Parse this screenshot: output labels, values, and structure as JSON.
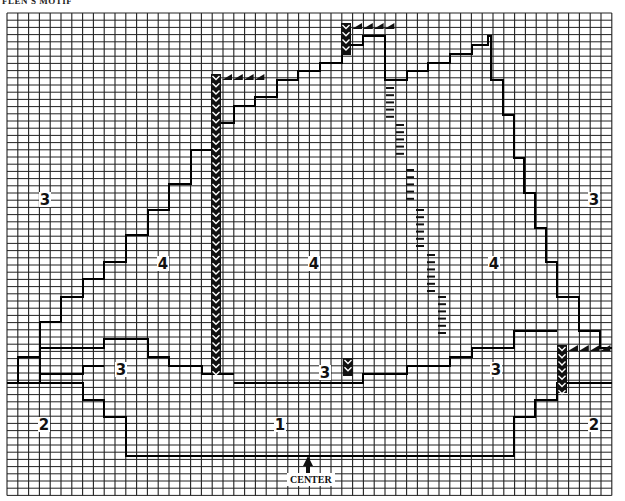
{
  "title": "FLEN'S MOTIF",
  "center_label": "CENTER",
  "grid": {
    "x0": 7,
    "y0": 13,
    "cols": 56,
    "rows": 67,
    "cell_w": 10.8,
    "cell_h": 7.2,
    "line_color": "#222222"
  },
  "zones": [
    {
      "label": "3",
      "x": 45,
      "y": 200
    },
    {
      "label": "4",
      "x": 163,
      "y": 264
    },
    {
      "label": "4",
      "x": 314,
      "y": 264
    },
    {
      "label": "4",
      "x": 494,
      "y": 264
    },
    {
      "label": "3",
      "x": 594,
      "y": 200
    },
    {
      "label": "3",
      "x": 121,
      "y": 370
    },
    {
      "label": "3",
      "x": 325,
      "y": 373
    },
    {
      "label": "3",
      "x": 496,
      "y": 370
    },
    {
      "label": "2",
      "x": 44,
      "y": 425
    },
    {
      "label": "1",
      "x": 280,
      "y": 425
    },
    {
      "label": "2",
      "x": 594,
      "y": 425
    }
  ],
  "outlines": [
    [
      [
        7,
        383
      ],
      [
        18,
        383
      ],
      [
        18,
        357
      ],
      [
        40,
        357
      ],
      [
        40,
        322
      ],
      [
        61,
        322
      ],
      [
        61,
        297
      ],
      [
        83,
        297
      ],
      [
        83,
        279
      ],
      [
        104,
        279
      ],
      [
        104,
        262
      ],
      [
        126,
        262
      ],
      [
        126,
        235
      ],
      [
        148,
        235
      ],
      [
        148,
        210
      ],
      [
        169,
        210
      ],
      [
        169,
        184
      ],
      [
        191,
        184
      ],
      [
        191,
        150
      ],
      [
        212,
        150
      ],
      [
        212,
        123
      ],
      [
        234,
        123
      ],
      [
        234,
        106
      ],
      [
        255,
        106
      ],
      [
        255,
        97
      ],
      [
        277,
        97
      ],
      [
        277,
        80
      ],
      [
        298,
        80
      ],
      [
        298,
        71
      ],
      [
        320,
        71
      ],
      [
        320,
        63
      ],
      [
        342,
        63
      ],
      [
        342,
        45
      ],
      [
        363,
        45
      ],
      [
        363,
        36
      ],
      [
        385,
        36
      ],
      [
        385,
        80
      ],
      [
        407,
        80
      ],
      [
        407,
        71
      ],
      [
        428,
        71
      ],
      [
        428,
        63
      ],
      [
        450,
        63
      ],
      [
        450,
        54
      ],
      [
        472,
        54
      ],
      [
        472,
        45
      ],
      [
        488,
        45
      ],
      [
        488,
        36
      ],
      [
        491,
        36
      ],
      [
        491,
        80
      ],
      [
        503,
        80
      ],
      [
        503,
        115
      ],
      [
        514,
        115
      ],
      [
        514,
        158
      ],
      [
        524,
        158
      ],
      [
        524,
        193
      ],
      [
        535,
        193
      ],
      [
        535,
        228
      ],
      [
        546,
        228
      ],
      [
        546,
        262
      ],
      [
        557,
        262
      ],
      [
        557,
        297
      ],
      [
        579,
        297
      ],
      [
        579,
        331
      ],
      [
        600,
        331
      ],
      [
        600,
        348
      ],
      [
        612,
        348
      ]
    ],
    [
      [
        40,
        383
      ],
      [
        40,
        348
      ],
      [
        104,
        348
      ],
      [
        104,
        339
      ],
      [
        148,
        339
      ],
      [
        148,
        357
      ],
      [
        169,
        357
      ],
      [
        169,
        366
      ],
      [
        202,
        366
      ],
      [
        202,
        374
      ],
      [
        234,
        374
      ]
    ],
    [
      [
        40,
        374
      ],
      [
        83,
        374
      ],
      [
        83,
        366
      ],
      [
        104,
        366
      ]
    ],
    [
      [
        7,
        383
      ],
      [
        83,
        383
      ],
      [
        83,
        400
      ],
      [
        104,
        400
      ],
      [
        104,
        417
      ],
      [
        126,
        417
      ],
      [
        126,
        434
      ],
      [
        126,
        456
      ],
      [
        514,
        456
      ],
      [
        514,
        417
      ],
      [
        535,
        417
      ],
      [
        535,
        400
      ],
      [
        557,
        400
      ],
      [
        557,
        383
      ],
      [
        612,
        383
      ]
    ],
    [
      [
        234,
        383
      ],
      [
        363,
        383
      ],
      [
        363,
        374
      ],
      [
        407,
        374
      ],
      [
        407,
        366
      ],
      [
        450,
        366
      ],
      [
        450,
        357
      ],
      [
        472,
        357
      ],
      [
        472,
        348
      ],
      [
        514,
        348
      ],
      [
        514,
        331
      ],
      [
        557,
        331
      ]
    ]
  ],
  "chevron_columns": [
    {
      "x": 216,
      "y0": 74,
      "y1": 374
    },
    {
      "x": 346,
      "y0": 23,
      "y1": 55
    },
    {
      "x": 348,
      "y0": 358,
      "y1": 376
    },
    {
      "x": 562,
      "y0": 345,
      "y1": 393
    }
  ],
  "triangle_rows": [
    {
      "x0": 222,
      "y": 74,
      "count": 4
    },
    {
      "x0": 352,
      "y": 23,
      "count": 4
    },
    {
      "x0": 568,
      "y": 345,
      "count": 4
    }
  ],
  "dash_columns": [
    {
      "x": 390,
      "y0": 88,
      "y1": 120
    },
    {
      "x": 400,
      "y0": 125,
      "y1": 160
    },
    {
      "x": 410,
      "y0": 170,
      "y1": 205
    },
    {
      "x": 420,
      "y0": 210,
      "y1": 250
    },
    {
      "x": 431,
      "y0": 255,
      "y1": 292
    },
    {
      "x": 442,
      "y0": 297,
      "y1": 340
    }
  ]
}
